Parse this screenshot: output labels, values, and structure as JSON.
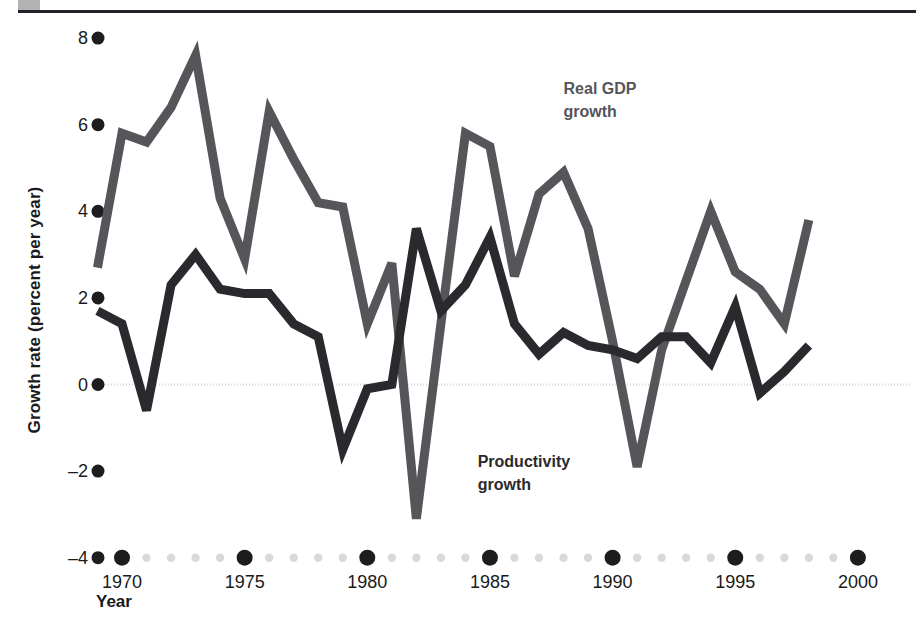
{
  "figure": {
    "corner_marker": "gray-square",
    "rule_color": "#23232a"
  },
  "chart_data": {
    "type": "line",
    "title": "",
    "xlabel": "Year",
    "ylabel": "Growth rate (percent per year)",
    "xlim": [
      1969,
      2001
    ],
    "ylim": [
      -4,
      8
    ],
    "yticks": [
      8,
      6,
      4,
      2,
      0,
      -2,
      -4
    ],
    "ytick_labels": [
      "8",
      "6",
      "4",
      "2",
      "0",
      "–2",
      "–4"
    ],
    "xticks": [
      1970,
      1975,
      1980,
      1985,
      1990,
      1995,
      2000
    ],
    "xtick_labels": [
      "1970",
      "1975",
      "1980",
      "1985",
      "1990",
      "1995",
      "2000"
    ],
    "x_minor_years": [
      1971,
      1972,
      1973,
      1974,
      1976,
      1977,
      1978,
      1979,
      1981,
      1982,
      1983,
      1984,
      1986,
      1987,
      1988,
      1989,
      1991,
      1992,
      1993,
      1994,
      1996,
      1997,
      1998,
      1999
    ],
    "grid": false,
    "zero_line": true,
    "zero_line_color": "#d8d8d8",
    "legend_position": "inside",
    "x": [
      1969,
      1970,
      1971,
      1972,
      1973,
      1974,
      1975,
      1976,
      1977,
      1978,
      1979,
      1980,
      1981,
      1982,
      1983,
      1984,
      1985,
      1986,
      1987,
      1988,
      1989,
      1990,
      1991,
      1992,
      1993,
      1994,
      1995,
      1996,
      1997,
      1998
    ],
    "series": [
      {
        "name": "Real GDP growth",
        "label": "Real GDP\ngrowth",
        "label_line1": "Real GDP",
        "label_line2": "growth",
        "color": "#55555a",
        "values": [
          2.7,
          5.8,
          5.6,
          6.4,
          7.6,
          4.3,
          2.9,
          6.3,
          5.2,
          4.2,
          4.1,
          1.4,
          2.8,
          -3.1,
          1.4,
          5.8,
          5.5,
          2.5,
          4.4,
          4.9,
          3.6,
          1.0,
          -1.9,
          0.8,
          2.4,
          4.0,
          2.6,
          2.2,
          1.4,
          3.8
        ]
      },
      {
        "name": "Productivity growth",
        "label": "Productivity\ngrowth",
        "label_line1": "Productivity",
        "label_line2": "growth",
        "color": "#2a2a2e",
        "values": [
          1.7,
          1.4,
          -0.6,
          2.3,
          3.0,
          2.2,
          2.1,
          2.1,
          1.4,
          1.1,
          -1.5,
          -0.1,
          0.0,
          3.6,
          1.7,
          2.3,
          3.4,
          1.4,
          0.7,
          1.2,
          0.9,
          0.8,
          0.6,
          1.1,
          1.1,
          0.5,
          1.8,
          -0.2,
          0.3,
          0.9
        ]
      }
    ],
    "series_end_values": {
      "Real GDP growth": 2.7,
      "Productivity growth": 0.3
    },
    "annotations": [
      {
        "text": "Real GDP growth",
        "x": 1988,
        "y": 6.7,
        "color": "#55555a"
      },
      {
        "text": "Productivity growth",
        "x": 1984.5,
        "y": -1.9,
        "color": "#2a2a2e"
      }
    ]
  }
}
